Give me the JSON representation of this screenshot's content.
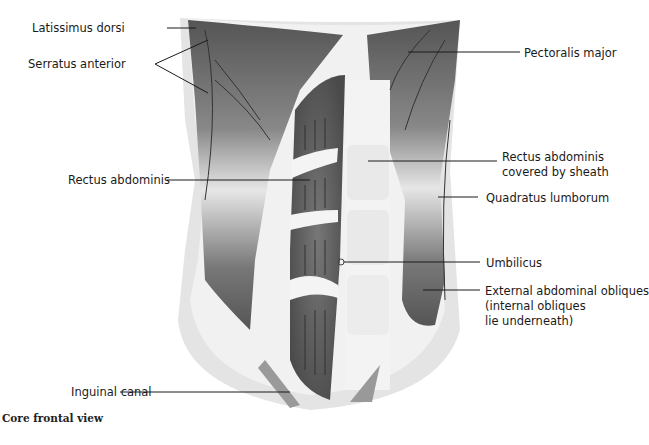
{
  "caption": "Core frontal view",
  "labels": {
    "latissimus": "Latissimus dorsi",
    "serratus": "Serratus anterior",
    "rectus": "Rectus abdominis",
    "inguinal": "Inguinal canal",
    "pectoralis": "Pectoralis major",
    "sheath_1": "Rectus abdominis",
    "sheath_2": "covered by sheath",
    "quadratus": "Quadratus lumborum",
    "umbilicus": "Umbilicus",
    "obliques_1": "External abdominal obliques",
    "obliques_2": "(internal obliques",
    "obliques_3": "lie underneath)"
  },
  "colors": {
    "muscle_dark": "#5a5a5a",
    "sheath_light": "#e8e8e8",
    "outline": "#d0d0d0",
    "leader_line": "#1a1a1a"
  }
}
